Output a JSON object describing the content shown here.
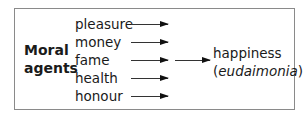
{
  "diagram": {
    "source_label_line1": "Moral",
    "source_label_line2": "agents",
    "items": [
      {
        "label": "pleasure"
      },
      {
        "label": "money"
      },
      {
        "label": "fame"
      },
      {
        "label": "health"
      },
      {
        "label": "honour"
      }
    ],
    "outcome": {
      "label": "happiness",
      "open_paren": "(",
      "term": "eudaimonia",
      "close_paren": ")"
    },
    "colors": {
      "border": "#8a8a8a",
      "text": "#1a1a1a",
      "arrow": "#111111"
    }
  }
}
